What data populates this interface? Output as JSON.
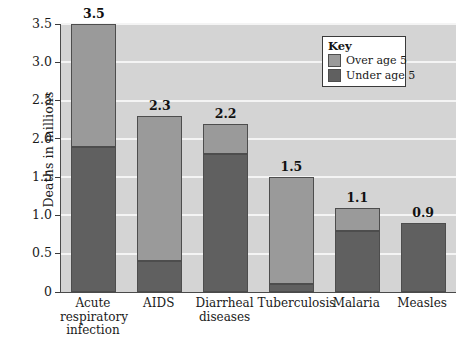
{
  "chart_data": {
    "type": "bar",
    "subtype": "stacked-vertical",
    "title": "",
    "xlabel": "",
    "ylabel": "Deaths in millions",
    "ylim": [
      0,
      3.5
    ],
    "ytick_labels": [
      "0",
      "0.5",
      "1.0",
      "1.5",
      "2.0",
      "2.5",
      "3.0",
      "3.5"
    ],
    "ytick_values": [
      0,
      0.5,
      1.0,
      1.5,
      2.0,
      2.5,
      3.0,
      3.5
    ],
    "grid": true,
    "grid_color": "#f4f4f4",
    "plot_background": "#d4d4d4",
    "legend_position": "top-right",
    "categories": [
      "Acute respiratory infection",
      "AIDS",
      "Diarrheal diseases",
      "Tuberculosis",
      "Malaria",
      "Measles"
    ],
    "category_label_lines": [
      [
        "Acute",
        "respiratory",
        "infection"
      ],
      [
        "AIDS"
      ],
      [
        "Diarrheal",
        "diseases"
      ],
      [
        "Tuberculosis"
      ],
      [
        "Malaria"
      ],
      [
        "Measles"
      ]
    ],
    "series": [
      {
        "name": "Under age 5",
        "color": "#606060",
        "values": [
          1.9,
          0.4,
          1.8,
          0.1,
          0.8,
          0.9
        ]
      },
      {
        "name": "Over age 5",
        "color": "#9a9a9a",
        "values": [
          1.6,
          1.9,
          0.4,
          1.4,
          0.3,
          0.0
        ]
      }
    ],
    "totals": [
      3.5,
      2.3,
      2.2,
      1.5,
      1.1,
      0.9
    ],
    "total_labels": [
      "3.5",
      "2.3",
      "2.2",
      "1.5",
      "1.1",
      "0.9"
    ]
  },
  "legend": {
    "title": "Key",
    "entries": [
      {
        "label": "Over age 5",
        "color": "#9a9a9a"
      },
      {
        "label": "Under age 5",
        "color": "#606060"
      }
    ]
  }
}
